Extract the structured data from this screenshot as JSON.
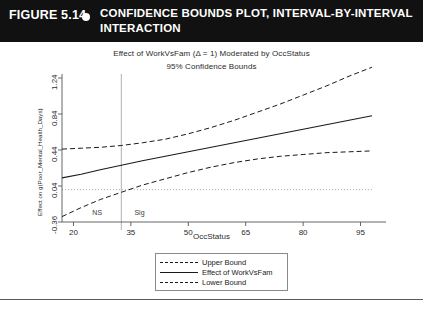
{
  "figure_header": {
    "figure_number": "FIGURE 5.14",
    "bullet_icon": "bullet-dot-icon",
    "caption": "CONFIDENCE BOUNDS PLOT, INTERVAL-BY-INTERVAL INTERACTION",
    "background_color": "#111111",
    "text_color": "#ffffff"
  },
  "chart_data": {
    "type": "line",
    "title": "Effect of WorkVsFam (Δ = 1) Moderated by OccStatus",
    "subtitle": "95% Confidence Bounds",
    "xlabel": "OccStatus",
    "ylabel": "Effect on g(Poor_Mental_Health_Days)",
    "xlim": [
      17,
      98
    ],
    "ylim": [
      -0.36,
      1.24
    ],
    "xticks": [
      20,
      35,
      50,
      65,
      80,
      95
    ],
    "yticks": [
      -0.36,
      0.04,
      0.44,
      0.84,
      1.24
    ],
    "xtick_labels": [
      "20",
      "35",
      "50",
      "65",
      "80",
      "95"
    ],
    "ytick_labels": [
      "-0.36",
      "0.04",
      "0.44",
      "0.84",
      "1.24"
    ],
    "grid": false,
    "legend_position": "below-center",
    "x": [
      17,
      22,
      27,
      32.5,
      38,
      44,
      50,
      56,
      62,
      68,
      74,
      80,
      86,
      92,
      98
    ],
    "series": [
      {
        "name": "Upper Bound",
        "style": "dashed",
        "color": "#1a1a1a",
        "values": [
          0.45,
          0.46,
          0.47,
          0.49,
          0.52,
          0.56,
          0.62,
          0.69,
          0.77,
          0.86,
          0.95,
          1.05,
          1.15,
          1.26,
          1.36
        ]
      },
      {
        "name": "Effect of WorkVsFam",
        "style": "solid",
        "color": "#1a1a1a",
        "values": [
          0.13,
          0.17,
          0.22,
          0.27,
          0.32,
          0.37,
          0.42,
          0.47,
          0.52,
          0.57,
          0.62,
          0.67,
          0.72,
          0.77,
          0.82
        ]
      },
      {
        "name": "Lower Bound",
        "style": "dashed",
        "color": "#1a1a1a",
        "values": [
          -0.3,
          -0.2,
          -0.11,
          -0.03,
          0.05,
          0.12,
          0.19,
          0.25,
          0.3,
          0.34,
          0.37,
          0.39,
          0.41,
          0.42,
          0.43
        ]
      }
    ],
    "reference_lines": [
      {
        "name": "zero-line",
        "orientation": "horizontal",
        "value": 0.0,
        "style": "dotted",
        "color": "#9a9a9a"
      },
      {
        "name": "significance-boundary",
        "orientation": "vertical",
        "value": 32.5,
        "style": "solid",
        "color": "#9a9a9a"
      }
    ],
    "annotations": [
      {
        "name": "ns-region-label",
        "text": "NS",
        "x": 26.5,
        "y": -0.27
      },
      {
        "name": "sig-region-label",
        "text": "Sig",
        "x": 37.5,
        "y": -0.27
      }
    ]
  },
  "legend": {
    "entries": [
      {
        "label": "Upper Bound",
        "style": "dashed"
      },
      {
        "label": "Effect of WorkVsFam",
        "style": "solid"
      },
      {
        "label": "Lower Bound",
        "style": "dashed"
      }
    ]
  }
}
